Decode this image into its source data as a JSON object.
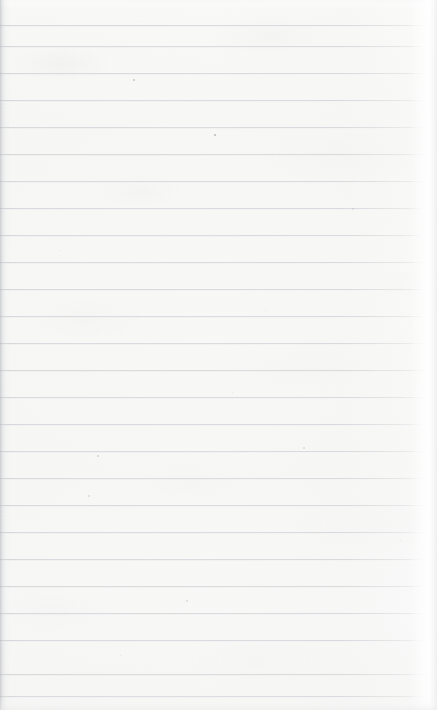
{
  "document": {
    "kind": "ruled-notebook-paper",
    "title": "Blank Ruled Notepad Page",
    "body_text": "",
    "page_width": 437,
    "page_height": 710,
    "is_blank": true
  },
  "paper": {
    "background_color": "#fbfbfa",
    "highlight_color": "#ffffff",
    "shadow_color": "#abadb1",
    "texture": "paper-fibre-mottle"
  },
  "rules": {
    "line_color": "#dbdce0",
    "line_thickness": 1,
    "spacing": 27,
    "first_line_y": 25,
    "count": 25,
    "positions": [
      25,
      46,
      73,
      100,
      127,
      154,
      181,
      208,
      235,
      262,
      289,
      316,
      343,
      370,
      397,
      424,
      451,
      478,
      505,
      532,
      559,
      586,
      613,
      640,
      674,
      696
    ]
  },
  "specks": [
    {
      "x": 133,
      "y": 79,
      "size": 2.0,
      "color": "rgba(150,152,158,0.55)"
    },
    {
      "x": 214,
      "y": 134,
      "size": 2.2,
      "color": "rgba(142,144,150,0.60)"
    },
    {
      "x": 97,
      "y": 455,
      "size": 1.8,
      "color": "rgba(168,170,176,0.45)"
    },
    {
      "x": 303,
      "y": 447,
      "size": 1.6,
      "color": "rgba(176,178,184,0.40)"
    },
    {
      "x": 88,
      "y": 495,
      "size": 1.5,
      "color": "rgba(180,182,188,0.38)"
    },
    {
      "x": 265,
      "y": 310,
      "size": 1.4,
      "color": "rgba(184,186,192,0.34)"
    },
    {
      "x": 352,
      "y": 208,
      "size": 1.5,
      "color": "rgba(182,184,190,0.36)"
    },
    {
      "x": 186,
      "y": 600,
      "size": 1.6,
      "color": "rgba(178,180,186,0.38)"
    },
    {
      "x": 120,
      "y": 655,
      "size": 1.4,
      "color": "rgba(186,188,194,0.32)"
    },
    {
      "x": 400,
      "y": 540,
      "size": 1.3,
      "color": "rgba(190,192,196,0.30)"
    },
    {
      "x": 232,
      "y": 392,
      "size": 1.3,
      "color": "rgba(188,190,195,0.30)"
    },
    {
      "x": 60,
      "y": 250,
      "size": 1.4,
      "color": "rgba(186,188,193,0.32)"
    }
  ]
}
